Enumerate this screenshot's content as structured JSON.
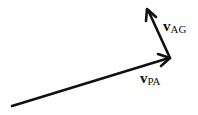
{
  "diagram": {
    "type": "vector-addition",
    "vectors": [
      {
        "id": "v_PA",
        "label_main": "v",
        "label_sub": "PA",
        "from": [
          12,
          106
        ],
        "to": [
          170,
          58
        ]
      },
      {
        "id": "v_AG",
        "label_main": "v",
        "label_sub": "AG",
        "from": [
          170,
          58
        ],
        "to": [
          147,
          8
        ]
      }
    ],
    "stroke_color": "#111111",
    "background": "#ffffff"
  }
}
